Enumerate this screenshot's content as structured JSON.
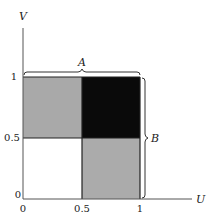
{
  "diagram": {
    "axes": {
      "x_label": "U",
      "y_label": "V",
      "x_ticks": [
        "0",
        "0.5",
        "1"
      ],
      "y_ticks": [
        "0",
        "0.5",
        "1"
      ]
    },
    "regions": [
      {
        "name": "top-left",
        "u": [
          0,
          0.5
        ],
        "v": [
          0.5,
          1
        ],
        "color": "#a9a9a9"
      },
      {
        "name": "top-right",
        "u": [
          0.5,
          1
        ],
        "v": [
          0.5,
          1
        ],
        "color": "#0a0a0a"
      },
      {
        "name": "bottom-left",
        "u": [
          0,
          0.5
        ],
        "v": [
          0,
          0.5
        ],
        "color": "#ffffff"
      },
      {
        "name": "bottom-right",
        "u": [
          0.5,
          1
        ],
        "v": [
          0,
          0.5
        ],
        "color": "#ababab"
      }
    ],
    "braces": {
      "top_label": "A",
      "right_label": "B"
    }
  }
}
